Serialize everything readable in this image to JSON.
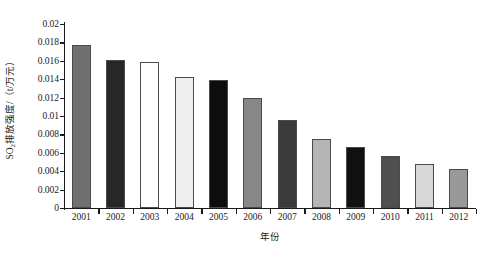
{
  "chart_data": {
    "type": "bar",
    "title": "",
    "xlabel": "年份",
    "ylabel_prefix": "SO",
    "ylabel_sub": "2",
    "ylabel_suffix": "排放强度/（t/万元）",
    "categories": [
      "2001",
      "2002",
      "2003",
      "2004",
      "2005",
      "2006",
      "2007",
      "2008",
      "2009",
      "2010",
      "2011",
      "2012"
    ],
    "values": [
      0.0177,
      0.0161,
      0.0159,
      0.0142,
      0.0139,
      0.012,
      0.0096,
      0.0075,
      0.0066,
      0.0057,
      0.0048,
      0.0042
    ],
    "bar_colors": [
      "#707070",
      "#272727",
      "#ffffff",
      "#efefef",
      "#0d0d0d",
      "#878787",
      "#3a3a3a",
      "#b5b5b5",
      "#111111",
      "#4f4f4f",
      "#d8d8d8",
      "#999999"
    ],
    "ylim": [
      0,
      0.02
    ],
    "yticks": [
      0,
      0.002,
      0.004,
      0.006,
      0.008,
      0.01,
      0.012,
      0.014,
      0.016,
      0.018,
      0.02
    ],
    "ytick_labels": [
      "0",
      "0.002",
      "0.004",
      "0.006",
      "0.008",
      "0.01",
      "0.012",
      "0.014",
      "0.016",
      "0.018",
      "0.02"
    ],
    "grid": false,
    "legend": "none",
    "axis_color": "#1a1a1a",
    "background": "#ffffff"
  }
}
